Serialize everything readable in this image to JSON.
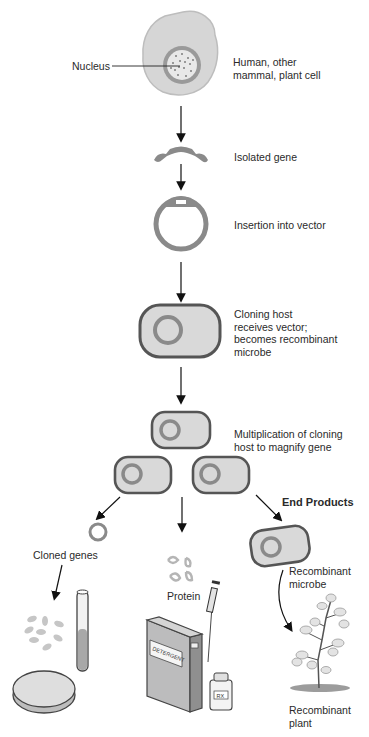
{
  "diagram": {
    "steps": [
      {
        "label": "Human, other\nmammal, plant cell",
        "pointer_label": "Nucleus"
      },
      {
        "label": "Isolated gene"
      },
      {
        "label": "Insertion into vector"
      },
      {
        "label": "Cloning host\nreceives vector;\nbecomes recombinant\nmicrobe"
      },
      {
        "label": "Multiplication of cloning\nhost to magnify gene"
      }
    ],
    "end_products": {
      "heading": "End Products",
      "items": [
        {
          "label": "Cloned genes"
        },
        {
          "label": "Protein"
        },
        {
          "label": "Recombinant\nmicrobe"
        },
        {
          "label": "Recombinant\nplant"
        }
      ],
      "box_label": "DETERGENT",
      "bottle_label": "RX"
    },
    "colors": {
      "cell": "#d4d4d4",
      "cell_edge": "#b5b5b5",
      "gene": "#8a8a8a",
      "host_outline": "#555555",
      "arrow": "#111111"
    }
  }
}
